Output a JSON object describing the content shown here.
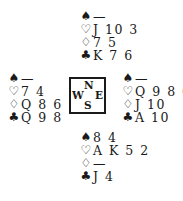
{
  "diagram": {
    "type": "bridge-deal",
    "suit_symbols": {
      "spades": "♠",
      "hearts": "♡",
      "diamonds": "♢",
      "clubs": "♣"
    },
    "compass": {
      "north": "N",
      "south": "S",
      "west": "W",
      "east": "E"
    },
    "hands": {
      "north": {
        "spades": "—",
        "hearts": "J 10 3",
        "diamonds": "7 5",
        "clubs": "K 7 6"
      },
      "west": {
        "spades": "—",
        "hearts": "7 4",
        "diamonds": "Q 8 6",
        "clubs": "Q 9 8"
      },
      "east": {
        "spades": "—",
        "hearts": "Q 9 8 6",
        "diamonds": "J 10",
        "clubs": "A 10"
      },
      "south": {
        "spades": "8 4",
        "hearts": "A K 5 2",
        "diamonds": "—",
        "clubs": "J 4"
      }
    }
  }
}
